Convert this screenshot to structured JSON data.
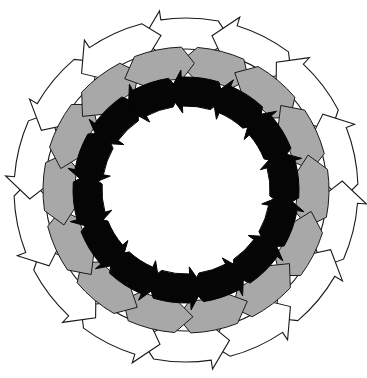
{
  "diagram": {
    "title": "",
    "center": [
      186,
      190
    ],
    "direction": "counterclockwise",
    "rings": [
      {
        "name": "outer-ring",
        "fill": "#ffffff",
        "stroke": "#1a1a1a",
        "count": 14,
        "inner_radius": 141,
        "outer_radius": 172,
        "head_extra": 9,
        "start_angle_deg": -92,
        "gap_deg": 0
      },
      {
        "name": "middle-ring",
        "fill": "#a8a8a8",
        "stroke": "#1a1a1a",
        "count": 14,
        "inner_radius": 111,
        "outer_radius": 143,
        "head_extra": 0,
        "start_angle_deg": -79,
        "gap_deg": 0
      },
      {
        "name": "inner-ring",
        "fill": "#050505",
        "stroke": "#050505",
        "count": 14,
        "inner_radius": 84,
        "outer_radius": 113,
        "head_extra": 7,
        "start_angle_deg": -86,
        "gap_deg": 0
      }
    ]
  }
}
